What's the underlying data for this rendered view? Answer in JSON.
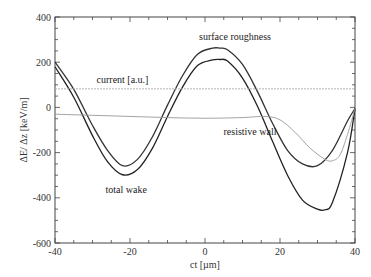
{
  "chart_data": {
    "type": "line",
    "title": "",
    "xlabel": "ct [µm]",
    "ylabel": "ΔE/ Δz [keV/m]",
    "xlim": [
      -40,
      40
    ],
    "ylim": [
      -600,
      400
    ],
    "x_ticks": [
      -40,
      -20,
      0,
      20,
      40
    ],
    "y_ticks": [
      400,
      200,
      0,
      -200,
      -400,
      -600
    ],
    "grid": false,
    "legend": "none (inline annotations)",
    "series": [
      {
        "name": "surface roughness",
        "color": "#333333",
        "x": [
          -40,
          -35,
          -30,
          -26,
          -22,
          -18,
          -14,
          -10,
          -6,
          -2,
          2,
          4,
          6,
          10,
          14,
          18,
          22,
          26,
          30,
          34,
          38,
          40
        ],
        "y": [
          200,
          80,
          -80,
          -190,
          -258,
          -230,
          -130,
          10,
          140,
          235,
          262,
          262,
          255,
          190,
          70,
          -70,
          -190,
          -250,
          -258,
          -190,
          -60,
          -5
        ]
      },
      {
        "name": "total wake",
        "color": "#222222",
        "x": [
          -40,
          -35,
          -30,
          -26,
          -22,
          -18,
          -14,
          -10,
          -6,
          -2,
          2,
          4,
          6,
          10,
          14,
          18,
          22,
          26,
          30,
          32,
          34,
          38,
          40
        ],
        "y": [
          180,
          45,
          -125,
          -240,
          -298,
          -275,
          -180,
          -40,
          90,
          185,
          210,
          212,
          205,
          130,
          5,
          -150,
          -300,
          -410,
          -450,
          -453,
          -420,
          -200,
          -5
        ]
      },
      {
        "name": "resistive wall",
        "color": "#999999",
        "x": [
          -40,
          -30,
          -20,
          -10,
          0,
          10,
          16,
          20,
          24,
          28,
          32,
          34,
          36,
          38,
          40
        ],
        "y": [
          -30,
          -35,
          -40,
          -45,
          -48,
          -45,
          -40,
          -55,
          -110,
          -180,
          -230,
          -236,
          -210,
          -120,
          -5
        ]
      },
      {
        "name": "current [a.u.]",
        "color": "#aaaaaa",
        "x": [
          -40,
          40
        ],
        "y": [
          82,
          82
        ]
      }
    ],
    "annotations": [
      {
        "text": "surface roughness",
        "x": 8,
        "y": 300
      },
      {
        "text": "current [a.u.]",
        "x": -22,
        "y": 110
      },
      {
        "text": "resistive wall",
        "x": 12,
        "y": -120
      },
      {
        "text": "total wake",
        "x": -21,
        "y": -380
      }
    ]
  }
}
